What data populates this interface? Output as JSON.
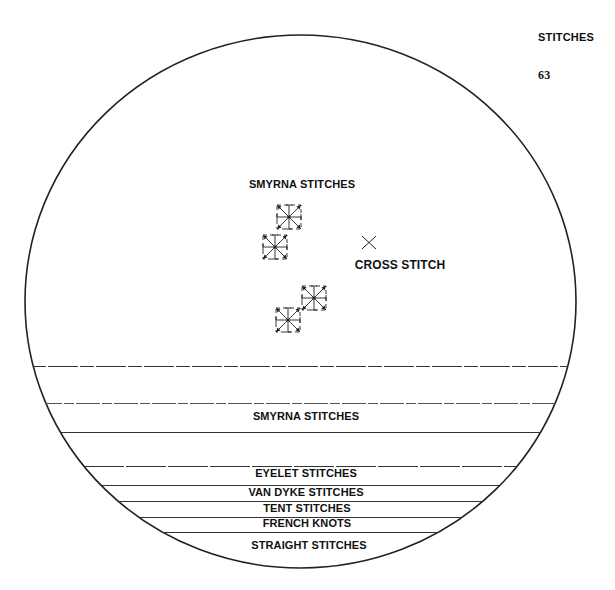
{
  "header": {
    "title": "STITCHES",
    "page_number": "63"
  },
  "diagram": {
    "upper_labels": {
      "smyrna": "SMYRNA STITCHES",
      "cross": "CROSS STITCH"
    },
    "icons": {
      "smyrna": "smyrna-stitch-icon",
      "cross": "cross-stitch-icon"
    },
    "bands": [
      {
        "label": "SMYRNA STITCHES"
      },
      {
        "label": "EYELET STITCHES"
      },
      {
        "label": "VAN DYKE STITCHES"
      },
      {
        "label": "TENT STITCHES"
      },
      {
        "label": "FRENCH KNOTS"
      },
      {
        "label": "STRAIGHT STITCHES"
      }
    ],
    "line_color": "#222222"
  }
}
